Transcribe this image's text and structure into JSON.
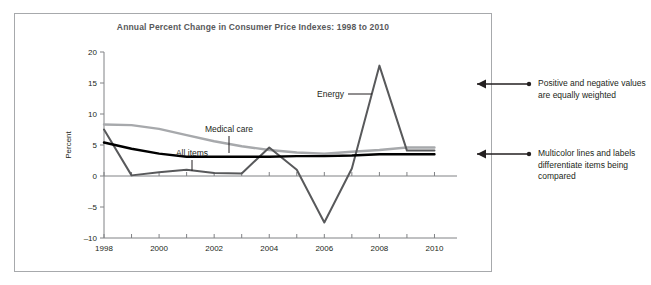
{
  "figure": {
    "title": "Annual Percent Change in Consumer Price Indexes: 1998 to 2010"
  },
  "annotations": [
    {
      "id": "annotation-positive-negative",
      "text": "Positive and negative values are equally weighted"
    },
    {
      "id": "annotation-multicolor",
      "text": "Multicolor lines and labels differentiate items being compared"
    }
  ],
  "series_labels": {
    "medical_care": "Medical care",
    "all_items": "All items",
    "energy": "Energy"
  },
  "colors": {
    "medical_care": "#a7a9ac",
    "all_items": "#000000",
    "energy": "#58595b",
    "axis": "#808285",
    "frame": "#a7a9ac",
    "title": "#58595b",
    "text": "#231f20"
  },
  "chart_data": {
    "type": "line",
    "title": "Annual Percent Change in Consumer Price Indexes: 1998 to 2010",
    "xlabel": "",
    "ylabel": "Percent",
    "x": [
      1998,
      1999,
      2000,
      2001,
      2002,
      2003,
      2004,
      2005,
      2006,
      2007,
      2008,
      2009,
      2010
    ],
    "xlim": [
      1998,
      2010.6
    ],
    "ylim": [
      -10,
      20
    ],
    "yticks": [
      -10,
      -5,
      0,
      5,
      10,
      15,
      20
    ],
    "xticks": [
      1998,
      1999,
      2000,
      2001,
      2002,
      2003,
      2004,
      2005,
      2006,
      2007,
      2008,
      2009,
      2010
    ],
    "xticklabels": [
      "1998",
      "",
      "2000",
      "",
      "2002",
      "",
      "2004",
      "",
      "2006",
      "",
      "2008",
      "",
      "2010"
    ],
    "yticklabels": [
      "-10",
      "-5",
      "0",
      "5",
      "10",
      "15",
      "20"
    ],
    "grid": false,
    "legend": "inline-labels",
    "series": [
      {
        "name": "Medical care",
        "color": "#a7a9ac",
        "values": [
          8.3,
          8.2,
          7.6,
          6.6,
          5.6,
          4.8,
          4.2,
          3.8,
          3.6,
          3.9,
          4.2,
          4.6,
          4.6
        ]
      },
      {
        "name": "All items",
        "color": "#000000",
        "values": [
          5.4,
          4.4,
          3.6,
          3.1,
          3.1,
          3.1,
          3.1,
          3.2,
          3.2,
          3.3,
          3.5,
          3.5,
          3.5
        ]
      },
      {
        "name": "Energy",
        "color": "#58595b",
        "values": [
          7.5,
          0.1,
          0.6,
          1.0,
          0.5,
          0.4,
          4.6,
          1.0,
          -7.5,
          1.2,
          17.8,
          4.1,
          4.1
        ]
      }
    ]
  }
}
